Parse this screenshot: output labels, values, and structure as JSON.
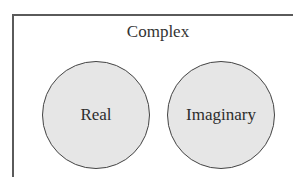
{
  "diagram": {
    "type": "venn",
    "container": {
      "label": "Complex"
    },
    "sets": [
      {
        "label": "Real",
        "fill": "#e6e6e6",
        "stroke": "#444444"
      },
      {
        "label": "Imaginary",
        "fill": "#e6e6e6",
        "stroke": "#444444"
      }
    ],
    "overlap": false
  }
}
